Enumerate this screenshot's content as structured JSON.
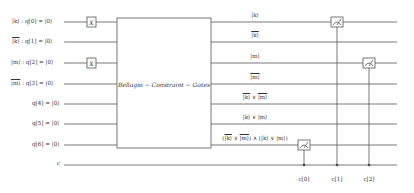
{
  "diagram": {
    "type": "quantum-circuit",
    "gate_block_label": "Bellagio − Constraint − Gates",
    "colors": {
      "wire": "#555555",
      "text": "#333333",
      "background": "#ffffff"
    },
    "qubits": [
      {
        "prefix": "|k⟩",
        "overline": false,
        "name": "q[0] = |0⟩",
        "y": 22,
        "x_gate": true,
        "output_label": "|k⟩",
        "output_overline": false
      },
      {
        "prefix": "|k⟩",
        "overline": true,
        "name": "q[1] = |0⟩",
        "y": 42,
        "x_gate": false,
        "output_label": "|k⟩",
        "output_overline": true
      },
      {
        "prefix": "|m⟩",
        "overline": false,
        "name": "q[2] = |0⟩",
        "y": 63,
        "x_gate": true,
        "output_label": "|m⟩",
        "output_overline": false
      },
      {
        "prefix": "|m⟩",
        "overline": true,
        "name": "q[3] = |0⟩",
        "y": 84,
        "x_gate": false,
        "output_label": "|m⟩",
        "output_overline": true
      },
      {
        "prefix": "",
        "overline": false,
        "name": "q[4] = |0⟩",
        "y": 104,
        "x_gate": false,
        "output_label": "|k̄⟩ ∨ |m̄⟩",
        "output_overline": false
      },
      {
        "prefix": "",
        "overline": false,
        "name": "q[5] = |0⟩",
        "y": 124,
        "x_gate": false,
        "output_label": "|k⟩ ∨ |m⟩",
        "output_overline": false
      },
      {
        "prefix": "",
        "overline": false,
        "name": "q[6] = |0⟩",
        "y": 145,
        "x_gate": false,
        "output_label": "(|k̄⟩ ∨ |m̄⟩) ∧ (|k⟩ ∨ |m⟩)",
        "output_overline": false
      }
    ],
    "classical": {
      "name": "c",
      "y": 165
    },
    "x_gate_label": "X",
    "measurements": [
      {
        "qubit": 6,
        "x": 304,
        "clbit_label": "c[0]"
      },
      {
        "qubit": 0,
        "x": 337,
        "clbit_label": "c[1]"
      },
      {
        "qubit": 2,
        "x": 369,
        "clbit_label": "c[2]"
      }
    ]
  },
  "labels": {
    "q0": "q[0] = |0⟩",
    "q1": "q[1] = |0⟩",
    "q2": "q[2] = |0⟩",
    "q3": "q[3] = |0⟩",
    "q4": "q[4] = |0⟩",
    "q5": "q[5] = |0⟩",
    "q6": "q[6] = |0⟩",
    "k": "|k⟩",
    "m": "|m⟩",
    "sep": " : ",
    "c": "c",
    "x": "X",
    "block": "Bellagio − Constraint − Gates",
    "out_k": "|k⟩",
    "out_m": "|m⟩",
    "out_or_neg_k": "|k⟩",
    "out_or": " ∨ ",
    "out_or_neg_m": "|m⟩",
    "out_and": ") ∧ (",
    "lp": "(",
    "rp": ")",
    "c0": "c[0]",
    "c1": "c[1]",
    "c2": "c[2]"
  }
}
